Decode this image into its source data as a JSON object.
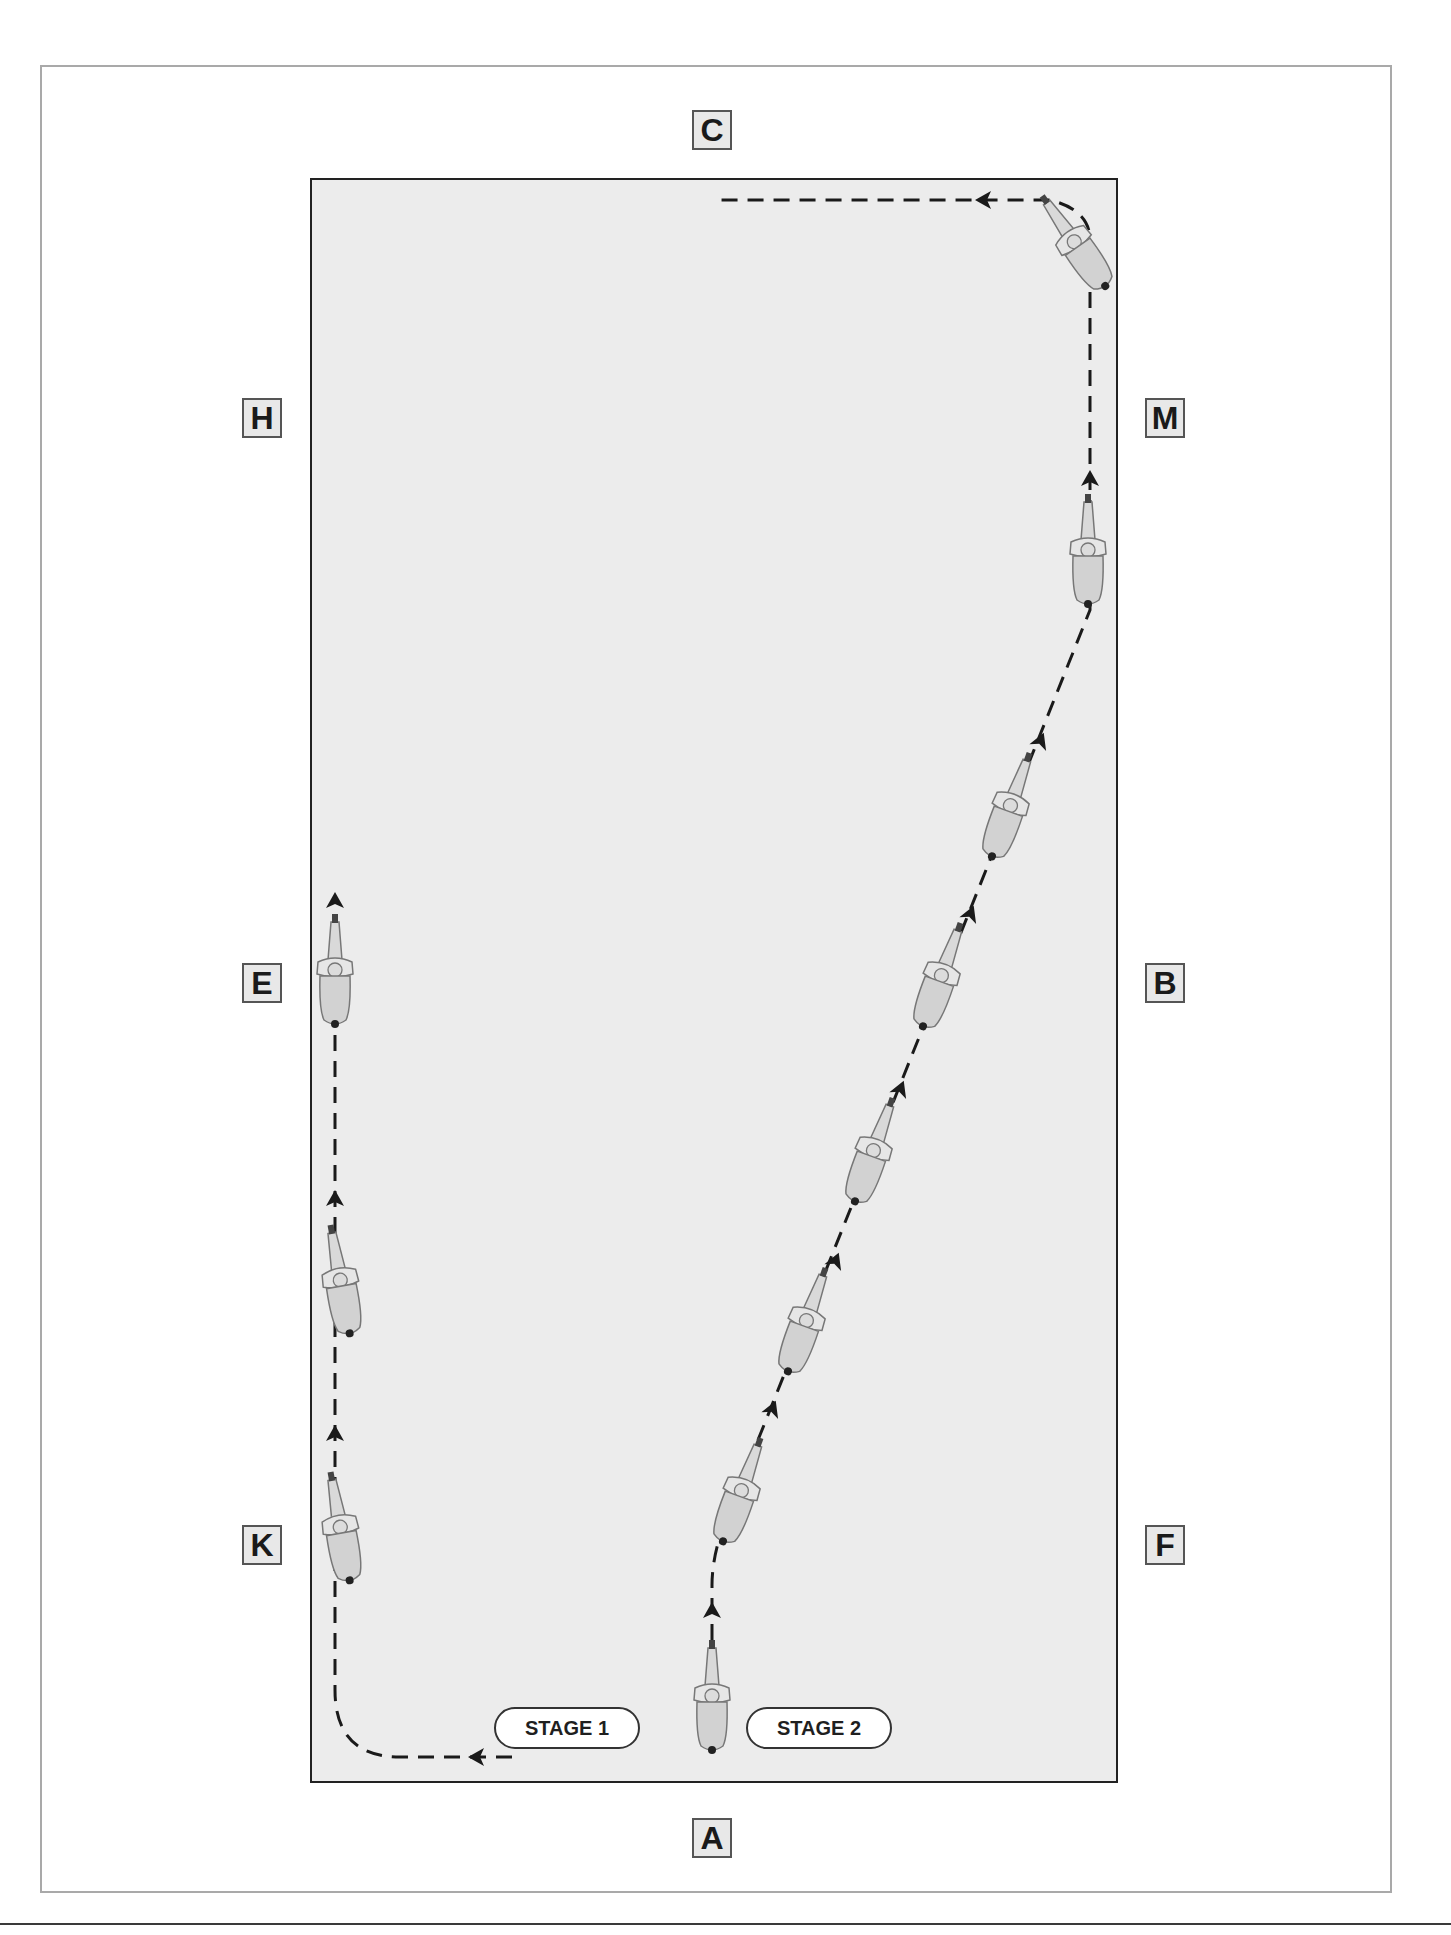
{
  "diagram": {
    "title": "",
    "arena_fill": "#ececec",
    "arena_border": "#222222",
    "markers": [
      {
        "letter": "C",
        "position": "top-center"
      },
      {
        "letter": "H",
        "position": "left-upper"
      },
      {
        "letter": "M",
        "position": "right-upper"
      },
      {
        "letter": "E",
        "position": "left-middle"
      },
      {
        "letter": "B",
        "position": "right-middle"
      },
      {
        "letter": "K",
        "position": "left-lower"
      },
      {
        "letter": "F",
        "position": "right-lower"
      },
      {
        "letter": "A",
        "position": "bottom-center"
      }
    ],
    "stages": [
      {
        "label": "STAGE 1"
      },
      {
        "label": "STAGE 2"
      }
    ],
    "icons": {
      "rider": "horse-and-rider-topdown-icon",
      "arrow": "direction-arrow-icon"
    },
    "paths": [
      {
        "name": "stage-1-path",
        "description": "From A turn left along short side to K, up long side past K and E"
      },
      {
        "name": "stage-2-path",
        "description": "From A up centre line, diagonal toward M, up track to corner, turn left toward C"
      }
    ]
  }
}
